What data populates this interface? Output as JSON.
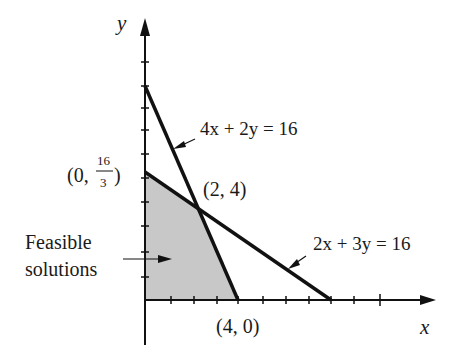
{
  "axes": {
    "x_label": "x",
    "y_label": "y"
  },
  "lines": [
    {
      "equation": "4x + 2y = 16",
      "x_intercept": [
        4,
        0
      ],
      "y_intercept": [
        0,
        8
      ]
    },
    {
      "equation": "2x + 3y = 16",
      "x_intercept": [
        8,
        0
      ],
      "y_intercept": [
        0,
        "16/3"
      ]
    }
  ],
  "points": {
    "y_intercept_label_open": "(0,",
    "y_intercept_num": "16",
    "y_intercept_den": "3",
    "y_intercept_label_close": ")",
    "intersection": "(2, 4)",
    "x_intercept": "(4, 0)"
  },
  "region": {
    "label_line1": "Feasible",
    "label_line2": "solutions",
    "fill": "#c8c8c8"
  },
  "colors": {
    "line": "#111111",
    "background": "#ffffff"
  }
}
